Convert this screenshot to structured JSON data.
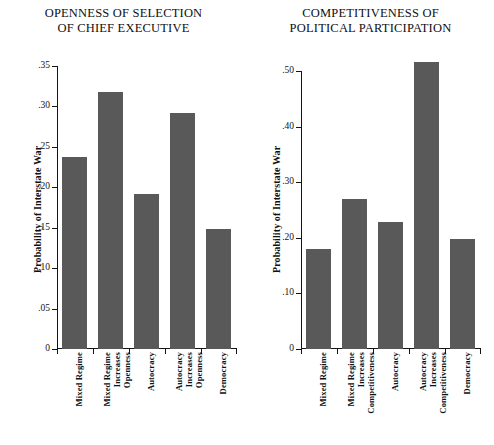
{
  "figure": {
    "bar_color": "#595959",
    "axis_color": "#141414",
    "background": "#ffffff"
  },
  "panels": [
    {
      "id": "openness",
      "title_line1": "OPENNESS OF SELECTION",
      "title_line2": "OF CHIEF EXECUTIVE",
      "ylabel": "Probability of Interstate War",
      "yticks": [
        "0",
        ".05",
        ".10",
        ".15",
        ".20",
        ".25",
        ".30",
        ".35"
      ],
      "categories": [
        [
          "Mixed Regime"
        ],
        [
          "Mixed Regime",
          "Increases",
          "Openness"
        ],
        [
          "Autocracy"
        ],
        [
          "Autocracy",
          "Increases",
          "Openness"
        ],
        [
          "Democracy"
        ]
      ]
    },
    {
      "id": "competitiveness",
      "title_line1": "COMPETITIVENESS OF",
      "title_line2": "POLITICAL PARTICIPATION",
      "ylabel": "Probability of Interstate War",
      "yticks": [
        "0",
        ".10",
        ".20",
        ".30",
        ".40",
        ".50"
      ],
      "categories": [
        [
          "Mixed Regime"
        ],
        [
          "Mixed Regime",
          "Increases",
          "Competitiveness"
        ],
        [
          "Autocracy"
        ],
        [
          "Autocracy",
          "Increases",
          "Competitiveness"
        ],
        [
          "Democracy"
        ]
      ]
    }
  ],
  "chart_data": [
    {
      "type": "bar",
      "title": "OPENNESS OF SELECTION OF CHIEF EXECUTIVE",
      "xlabel": "",
      "ylabel": "Probability of Interstate War",
      "ylim": [
        0,
        0.35
      ],
      "ytick_values": [
        0,
        0.05,
        0.1,
        0.15,
        0.2,
        0.25,
        0.3,
        0.35
      ],
      "ytick_labels": [
        "0",
        ".05",
        ".10",
        ".15",
        ".20",
        ".25",
        ".30",
        ".35"
      ],
      "grid": false,
      "legend": "none",
      "categories": [
        "Mixed Regime",
        "Mixed Regime Increases Openness",
        "Autocracy",
        "Autocracy Increases Openness",
        "Democracy"
      ],
      "values": [
        0.237,
        0.318,
        0.192,
        0.292,
        0.149
      ]
    },
    {
      "type": "bar",
      "title": "COMPETITIVENESS OF POLITICAL PARTICIPATION",
      "xlabel": "",
      "ylabel": "Probability of Interstate War",
      "ylim": [
        0,
        0.5
      ],
      "ytick_values": [
        0,
        0.1,
        0.2,
        0.3,
        0.4,
        0.5
      ],
      "ytick_labels": [
        "0",
        ".10",
        ".20",
        ".30",
        ".40",
        ".50"
      ],
      "grid": false,
      "legend": "none",
      "categories": [
        "Mixed Regime",
        "Mixed Regime Increases Competitiveness",
        "Autocracy",
        "Autocracy Increases Competitiveness",
        "Democracy"
      ],
      "values": [
        0.18,
        0.27,
        0.228,
        0.516,
        0.197
      ]
    }
  ]
}
